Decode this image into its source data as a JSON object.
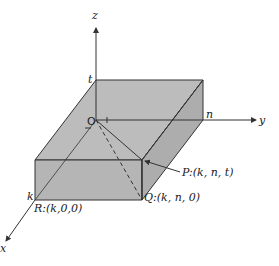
{
  "diagram": {
    "axes": {
      "x_label": "x",
      "y_label": "y",
      "z_label": "z"
    },
    "origin_label": "O",
    "dimension_labels": {
      "x_extent": "k",
      "y_extent": "n",
      "z_extent": "t"
    },
    "points": [
      {
        "name": "P",
        "label": "P:(k, n, t)"
      },
      {
        "name": "Q",
        "label": "Q:(k, n, 0)"
      },
      {
        "name": "R",
        "label": "R:(k,0,0)"
      }
    ],
    "colors": {
      "box_fill": "#b8b8b8",
      "box_side": "#a9a9a9",
      "line": "#333333",
      "background": "#ffffff"
    }
  }
}
